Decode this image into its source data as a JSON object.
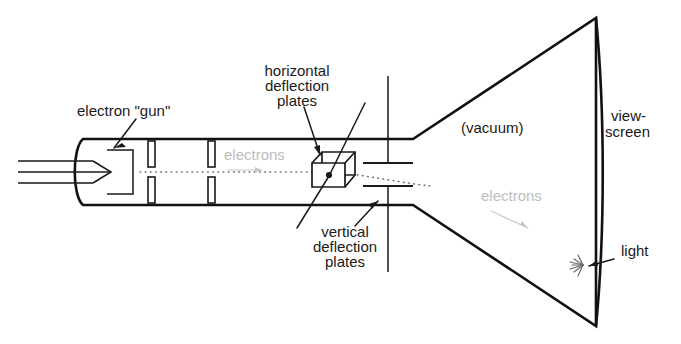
{
  "figure": {
    "background_color": "#ffffff",
    "ink_color": "#111111",
    "ghost_color": "#bdbdbd",
    "width": 681,
    "height": 344
  },
  "labels": {
    "electron_gun": "electron \"gun\"",
    "horizontal_plates_line1": "horizontal",
    "horizontal_plates_line2": "deflection",
    "horizontal_plates_line3": "plates",
    "vertical_plates_line1": "vertical",
    "vertical_plates_line2": "deflection",
    "vertical_plates_line3": "plates",
    "vacuum": "(vacuum)",
    "viewscreen_line1": "view-",
    "viewscreen_line2": "screen",
    "light": "light",
    "electrons_neck": "electrons",
    "electrons_cone": "electrons"
  },
  "parts": {
    "tube_neck": "tube-neck",
    "tube_cone": "tube-cone",
    "view_screen": "view-screen",
    "cathode": "cathode-arrow",
    "anode_apertures": "anode-apertures",
    "vertical_plates": "vertical-deflection-plates",
    "horizontal_plates": "horizontal-deflection-plates",
    "electron_beam": "electron-beam",
    "light_burst": "light-burst"
  }
}
